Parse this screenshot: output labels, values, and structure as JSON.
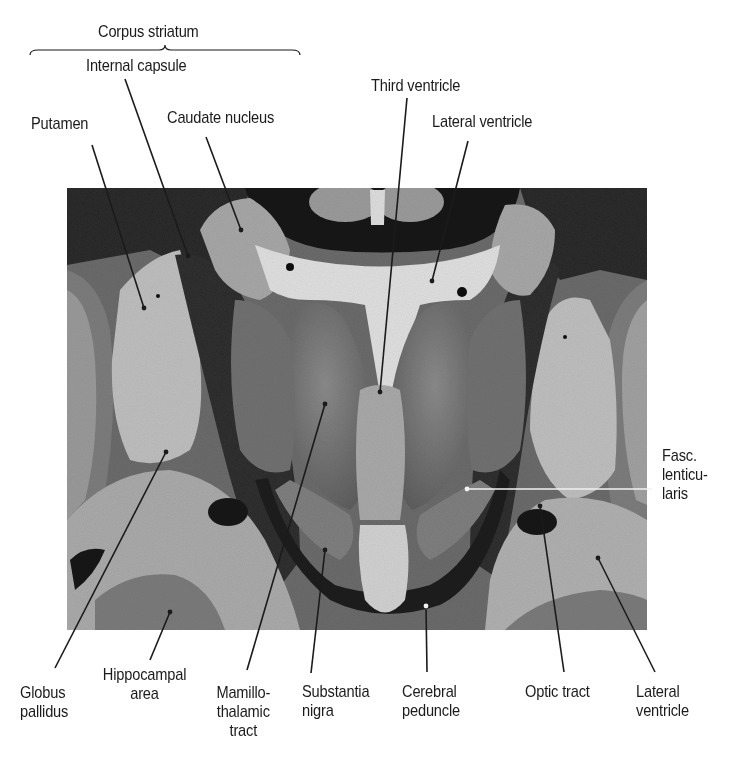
{
  "figure": {
    "colors": {
      "background": "#ffffff",
      "ink": "#1b1b1b",
      "tissue_dark": "#1e1e1e",
      "tissue_mid": "#5e5e5e",
      "tissue_light": "#9a9a9a",
      "tissue_pale": "#c9c9c9",
      "ventricle_white": "#e2e2e2"
    },
    "photo": {
      "x": 67,
      "y": 188,
      "width": 580,
      "height": 442
    },
    "bracket": {
      "label": "Corpus striatum",
      "x1": 30,
      "x2": 300,
      "y": 50
    },
    "labels": [
      {
        "id": "corpus-striatum",
        "text": "Corpus striatum",
        "x": 98,
        "y": 22
      },
      {
        "id": "internal-capsule",
        "text": "Internal capsule",
        "x": 86,
        "y": 56
      },
      {
        "id": "putamen",
        "text": "Putamen",
        "x": 31,
        "y": 114
      },
      {
        "id": "caudate-nucleus",
        "text": "Caudate nucleus",
        "x": 167,
        "y": 108
      },
      {
        "id": "third-ventricle",
        "text": "Third ventricle",
        "x": 371,
        "y": 76
      },
      {
        "id": "lateral-ventricle-top",
        "text": "Lateral ventricle",
        "x": 432,
        "y": 112
      },
      {
        "id": "fasc-lenticularis",
        "text": "Fasc.\nlenticu-\nlaris",
        "x": 662,
        "y": 446
      },
      {
        "id": "globus-pallidus",
        "text": "Globus\npallidus",
        "x": 20,
        "y": 683
      },
      {
        "id": "hippocampal-area",
        "text": "Hippocampal\narea",
        "x": 96,
        "y": 665
      },
      {
        "id": "mamillothalamic-tract",
        "text": "Mamillo-\nthalamic\ntract",
        "x": 212,
        "y": 683
      },
      {
        "id": "substantia-nigra",
        "text": "Substantia\nnigra",
        "x": 302,
        "y": 682
      },
      {
        "id": "cerebral-peduncle",
        "text": "Cerebral\npeduncle",
        "x": 402,
        "y": 682
      },
      {
        "id": "optic-tract",
        "text": "Optic tract",
        "x": 525,
        "y": 682
      },
      {
        "id": "lateral-ventricle-bottom",
        "text": "Lateral\nventricle",
        "x": 636,
        "y": 682
      }
    ],
    "leaders": [
      {
        "id": "putamen-leader",
        "x1": 92,
        "y1": 145,
        "x2": 144,
        "y2": 308
      },
      {
        "id": "internal-capsule-leader",
        "x1": 125,
        "y1": 79,
        "x2": 188,
        "y2": 256
      },
      {
        "id": "caudate-leader",
        "x1": 206,
        "y1": 137,
        "x2": 241,
        "y2": 230
      },
      {
        "id": "third-ventricle-leader",
        "x1": 407,
        "y1": 98,
        "x2": 380,
        "y2": 392
      },
      {
        "id": "lateral-ventricle-top-leader",
        "x1": 468,
        "y1": 141,
        "x2": 432,
        "y2": 281
      },
      {
        "id": "fasc-lenticularis-leader",
        "x1": 652,
        "y1": 489,
        "x2": 467,
        "y2": 489,
        "white": true
      },
      {
        "id": "globus-pallidus-leader",
        "x1": 55,
        "y1": 668,
        "x2": 166,
        "y2": 452
      },
      {
        "id": "hippocampal-leader",
        "x1": 150,
        "y1": 660,
        "x2": 170,
        "y2": 612
      },
      {
        "id": "mamillothalamic-leader",
        "x1": 247,
        "y1": 670,
        "x2": 325,
        "y2": 404
      },
      {
        "id": "substantia-nigra-leader",
        "x1": 311,
        "y1": 673,
        "x2": 325,
        "y2": 550
      },
      {
        "id": "cerebral-peduncle-leader",
        "x1": 427,
        "y1": 672,
        "x2": 426,
        "y2": 606,
        "white_top": true
      },
      {
        "id": "optic-tract-leader",
        "x1": 564,
        "y1": 672,
        "x2": 540,
        "y2": 506
      },
      {
        "id": "lateral-ventricle-bottom-leader",
        "x1": 655,
        "y1": 672,
        "x2": 598,
        "y2": 558
      }
    ]
  }
}
